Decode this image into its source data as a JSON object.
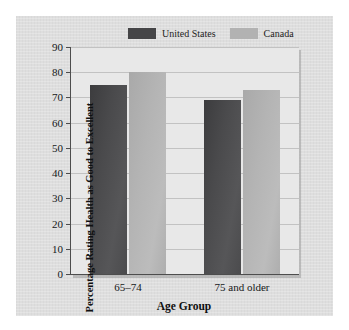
{
  "chart_data": {
    "type": "bar",
    "title": "",
    "subtitle": "",
    "xlabel": "Age Group",
    "ylabel": "Percentage Rating Health as Good to Excellent",
    "categories": [
      "65–74",
      "75 and older"
    ],
    "series": [
      {
        "name": "United States",
        "values": [
          75,
          69
        ],
        "color": "#4a4a4c"
      },
      {
        "name": "Canada",
        "values": [
          80,
          73
        ],
        "color": "#b4b4b4"
      }
    ],
    "ylim": [
      0,
      90
    ],
    "ytick_step": 10,
    "yticks": [
      0,
      10,
      20,
      30,
      40,
      50,
      60,
      70,
      80,
      90
    ],
    "ytick_labels": [
      "0",
      "10",
      "20",
      "30",
      "40",
      "50",
      "60",
      "70",
      "80",
      "90"
    ],
    "grid": true,
    "grid_axis": "y",
    "legend_position": "top",
    "legend": [
      "United States",
      "Canada"
    ],
    "annotations": [],
    "plot_background": "#e8e8e8",
    "figure_background": "#dedede"
  }
}
